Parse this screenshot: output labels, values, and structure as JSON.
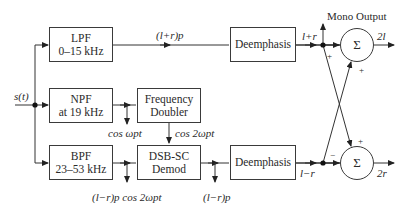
{
  "diagram": {
    "type": "FM stereo demodulator block diagram",
    "input": "s(t)",
    "blocks": [
      {
        "id": "lpf",
        "line1": "LPF",
        "line2": "0–15 kHz"
      },
      {
        "id": "npf",
        "line1": "NPF",
        "line2": "at 19 kHz"
      },
      {
        "id": "bpf",
        "line1": "BPF",
        "line2": "23–53 kHz"
      },
      {
        "id": "doubler",
        "line1": "Frequency",
        "line2": "Doubler"
      },
      {
        "id": "demod",
        "line1": "DSB-SC",
        "line2": "Demod"
      },
      {
        "id": "deemph_top",
        "line1": "Deemphasis"
      },
      {
        "id": "deemph_bottom",
        "line1": "Deemphasis"
      }
    ],
    "summers": [
      {
        "id": "sum_top",
        "symbol": "Σ",
        "output": "2l",
        "signs": [
          "+",
          "+"
        ]
      },
      {
        "id": "sum_bottom",
        "symbol": "Σ",
        "output": "2r",
        "signs": [
          "−",
          "+"
        ]
      }
    ],
    "signals": {
      "lpf_out": "(l+r)p",
      "deemph_top_out": "l+r",
      "deemph_bottom_out": "l−r",
      "pilot": "cos ωpt",
      "doubled_pilot": "cos 2ωpt",
      "bpf_out": "(l−r)p cos 2ωpt",
      "demod_out": "(l−r)p"
    },
    "mono_output_label": "Mono Output"
  }
}
